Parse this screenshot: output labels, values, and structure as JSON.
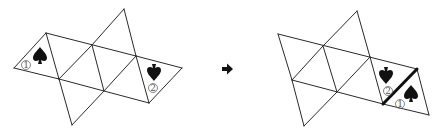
{
  "figures": [
    {
      "name": "before",
      "faces": [
        {
          "id": "face-1",
          "label": "①",
          "number": "1",
          "symbol": "spade",
          "orientation": "upright"
        },
        {
          "id": "face-2",
          "label": "②",
          "number": "2",
          "symbol": "spade",
          "orientation": "inverted"
        }
      ]
    },
    {
      "name": "after",
      "faces": [
        {
          "id": "face-2",
          "label": "②",
          "number": "2",
          "symbol": "spade",
          "orientation": "inverted"
        },
        {
          "id": "face-1",
          "label": "①",
          "number": "1",
          "symbol": "spade",
          "orientation": "upright"
        }
      ],
      "highlighted_edge": "thick line between faces ② and ①"
    }
  ],
  "arrow": {
    "glyph": "➡",
    "direction": "right"
  },
  "colors": {
    "line": "#2a2a2a",
    "symbol": "#111111",
    "label": "#555555"
  }
}
